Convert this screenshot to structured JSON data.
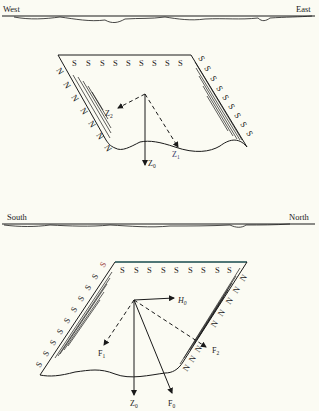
{
  "figures": [
    {
      "id": "top",
      "orientation": {
        "left": "West",
        "right": "East"
      },
      "top_edge_pole": "S",
      "top_edge_labels": [
        "S",
        "S",
        "S",
        "S",
        "S",
        "S",
        "S",
        "S",
        "S"
      ],
      "left_edge_pole": "N",
      "left_edge_labels": [
        "N",
        "N",
        "N",
        "N",
        "N",
        "N",
        "N"
      ],
      "right_edge_pole": "S",
      "right_edge_labels": [
        "S",
        "S",
        "S",
        "S",
        "S",
        "S",
        "S",
        "S",
        "S"
      ],
      "vectors": {
        "z0": {
          "base": "Z",
          "sub": "0"
        },
        "z1": {
          "base": "Z",
          "sub": "1"
        },
        "z2": {
          "base": "Z",
          "sub": "2"
        }
      }
    },
    {
      "id": "bottom",
      "orientation": {
        "left": "South",
        "right": "North"
      },
      "top_edge_pole": "S",
      "top_edge_labels": [
        "S",
        "S",
        "S",
        "S",
        "S",
        "S",
        "S",
        "S",
        "S"
      ],
      "left_edge_pole": "S",
      "left_edge_labels": [
        "S",
        "S",
        "S",
        "S",
        "S",
        "S",
        "S",
        "S",
        "S",
        "S"
      ],
      "right_edge_pole": "N",
      "right_edge_labels": [
        "N",
        "N",
        "N",
        "N",
        "N",
        "N",
        "N",
        "N"
      ],
      "vectors": {
        "h0": {
          "base": "H",
          "sub": "0"
        },
        "z0": {
          "base": "Z",
          "sub": "0"
        },
        "f0": {
          "base": "F",
          "sub": "0"
        },
        "f1": {
          "base": "F",
          "sub": "1"
        },
        "f2": {
          "base": "F",
          "sub": "2"
        }
      }
    }
  ],
  "colors": {
    "ink": "#1a1a1a",
    "paper": "#fbfbf3",
    "accent_top_edge": "#5fc6c9",
    "accent_label": "#9a3a3a"
  }
}
